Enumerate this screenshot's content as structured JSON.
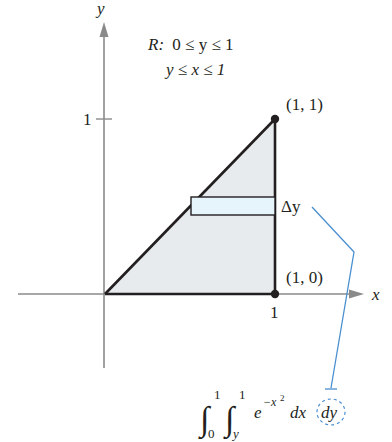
{
  "figure": {
    "axes": {
      "x_label": "x",
      "y_label": "y",
      "x_tick": "1",
      "y_tick": "1"
    },
    "region": {
      "name": "R",
      "line1_prefix": "R:",
      "line1": "0 ≤ y ≤ 1",
      "line2": "y ≤ x ≤ 1"
    },
    "points": [
      {
        "label": "(1, 1)",
        "x": 1,
        "y": 1
      },
      {
        "label": "(1, 0)",
        "x": 1,
        "y": 0
      }
    ],
    "strip": {
      "label": "Δy",
      "orientation": "horizontal"
    },
    "integral": {
      "outer_lower": "0",
      "outer_upper": "1",
      "inner_lower": "y",
      "inner_upper": "1",
      "integrand_base": "e",
      "integrand_exponent": "−x",
      "exponent_power": "2",
      "dx": "dx",
      "dy": "dy"
    },
    "colors": {
      "region_fill": "#e8ebee",
      "strip_fill": "#e5f5fb",
      "callout": "#4a8fd0",
      "axis": "#8a8a8a",
      "ink": "#231f20"
    }
  }
}
